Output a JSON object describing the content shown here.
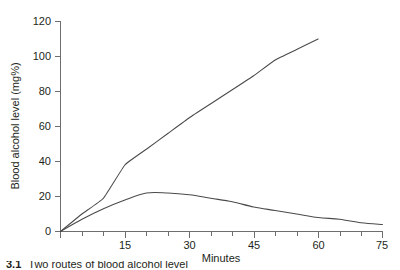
{
  "chart_data": {
    "type": "line",
    "title": "",
    "xlabel": "Minutes",
    "ylabel": "Blood alcohol level (mg%)",
    "xlim": [
      0,
      75
    ],
    "ylim": [
      0,
      120
    ],
    "grid": false,
    "legend": "none",
    "x_ticks_major": [
      0,
      15,
      30,
      45,
      60,
      75
    ],
    "x_tick_labels": [
      "0",
      "15",
      "30",
      "45",
      "60",
      "75"
    ],
    "x_ticks_minor": [
      5,
      10,
      20,
      25,
      35,
      40,
      50,
      55,
      65,
      70
    ],
    "y_ticks_major": [
      0,
      20,
      40,
      60,
      80,
      100,
      120
    ],
    "y_tick_labels": [
      "0",
      "20",
      "40",
      "60",
      "80",
      "100",
      "120"
    ],
    "series": [
      {
        "name": "upper-curve",
        "x": [
          0,
          5,
          10,
          15,
          20,
          25,
          30,
          35,
          40,
          45,
          50,
          55,
          60
        ],
        "values": [
          0,
          10,
          19,
          38,
          47,
          56,
          65,
          73,
          81,
          89,
          98,
          104,
          110
        ]
      },
      {
        "name": "lower-curve",
        "x": [
          0,
          5,
          10,
          15,
          20,
          25,
          30,
          35,
          40,
          45,
          50,
          55,
          60,
          65,
          70,
          75
        ],
        "values": [
          0,
          7,
          13,
          18,
          22,
          22,
          21,
          19,
          17,
          14,
          12,
          10,
          8,
          7,
          5,
          4
        ]
      }
    ]
  },
  "axis": {
    "y_title": "Blood alcohol level (mg%)",
    "x_title": "Minutes",
    "y_labels": [
      "120",
      "100",
      "80",
      "60",
      "40",
      "20",
      "0"
    ],
    "x_labels": [
      "15",
      "30",
      "45",
      "60",
      "75"
    ],
    "x_origin_label": "0"
  },
  "caption": {
    "number": "3.1",
    "text": "Two routes of blood alcohol level"
  },
  "colors": {
    "line": "#4a4a4a",
    "axis": "#6e6e6e",
    "text": "#231f20",
    "background": "#ffffff"
  }
}
